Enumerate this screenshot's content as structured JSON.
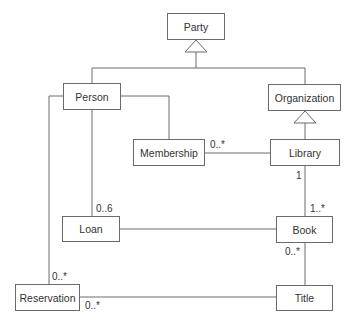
{
  "diagram": {
    "type": "UML class diagram",
    "classes": {
      "party": "Party",
      "person": "Person",
      "organization": "Organization",
      "membership": "Membership",
      "library": "Library",
      "loan": "Loan",
      "book": "Book",
      "reservation": "Reservation",
      "title": "Title"
    },
    "multiplicities": {
      "membership_library": "0..*",
      "library_book_library_end": "1",
      "library_book_book_end": "1..*",
      "person_loan": "0..6",
      "book_title_book_end": "0..*",
      "person_reservation": "0..*",
      "reservation_title": "0..*"
    },
    "relationships": [
      {
        "type": "generalization",
        "child": "Person",
        "parent": "Party"
      },
      {
        "type": "generalization",
        "child": "Organization",
        "parent": "Party"
      },
      {
        "type": "generalization",
        "child": "Library",
        "parent": "Organization"
      },
      {
        "type": "association",
        "from": "Person",
        "to": "Membership"
      },
      {
        "type": "association",
        "from": "Membership",
        "to": "Library"
      },
      {
        "type": "association",
        "from": "Library",
        "to": "Book"
      },
      {
        "type": "association",
        "from": "Person",
        "to": "Loan"
      },
      {
        "type": "association",
        "from": "Loan",
        "to": "Book"
      },
      {
        "type": "association",
        "from": "Book",
        "to": "Title"
      },
      {
        "type": "association",
        "from": "Person",
        "to": "Reservation"
      },
      {
        "type": "association",
        "from": "Reservation",
        "to": "Title"
      }
    ]
  }
}
